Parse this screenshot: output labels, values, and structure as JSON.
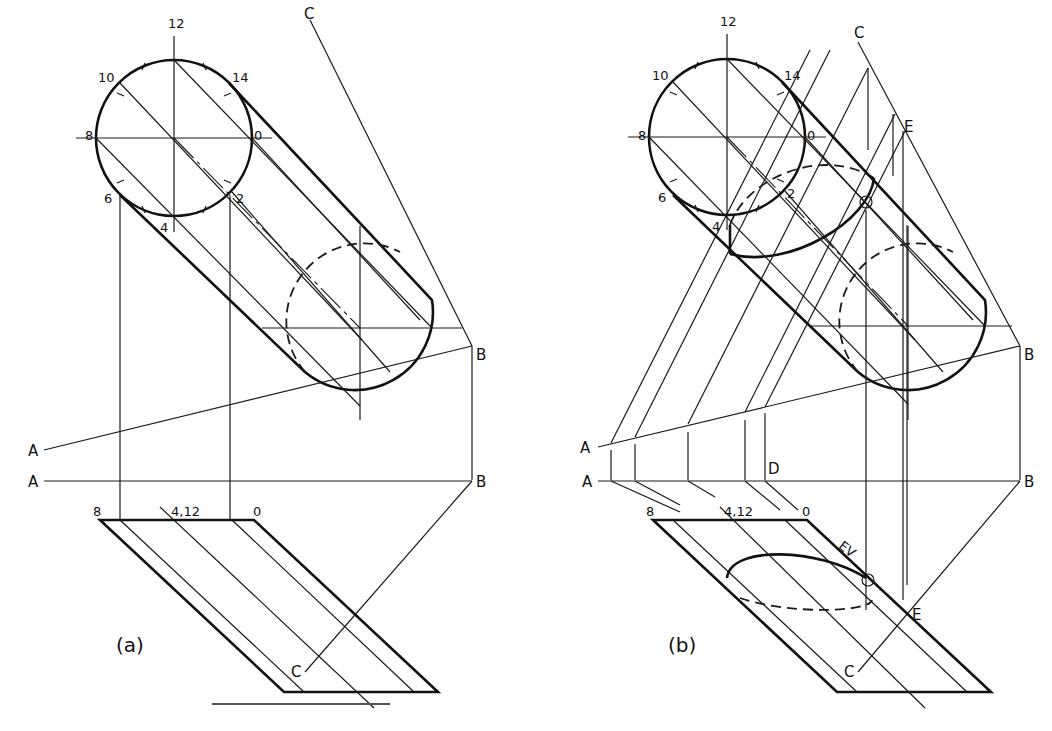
{
  "figure": {
    "panels": [
      {
        "id": "a",
        "caption": "(a)",
        "circle_labels": {
          "p12": "12",
          "p10": "10",
          "p14": "14",
          "p8": "8",
          "p0": "0",
          "p6": "6",
          "p2": "2",
          "p4": "4"
        },
        "edge_labels": {
          "C_top": "C",
          "B_right": "B",
          "A_upper": "A",
          "A_lower": "A",
          "B_lower": "B",
          "C_bottom": "C"
        },
        "plan_labels": {
          "p8": "8",
          "p412": "4,12",
          "p0": "0"
        }
      },
      {
        "id": "b",
        "caption": "(b)",
        "circle_labels": {
          "p12": "12",
          "p10": "10",
          "p14": "14",
          "p8": "8",
          "p0": "0",
          "p6": "6",
          "p2": "2",
          "p4": "4"
        },
        "edge_labels": {
          "C_top": "C",
          "E_top": "E",
          "B_right": "B",
          "A_upper": "A",
          "A_lower": "A",
          "D": "D",
          "B_lower": "B",
          "E_bottom": "E",
          "C_bottom": "C",
          "EV": "EV"
        },
        "plan_labels": {
          "p8": "8",
          "p412": "4,12",
          "p0": "0"
        }
      }
    ]
  }
}
